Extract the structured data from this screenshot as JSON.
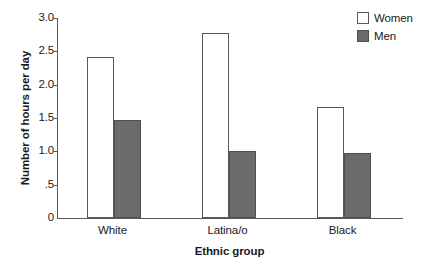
{
  "chart_data": {
    "type": "bar",
    "title": "",
    "subtitle": "",
    "xlabel": "Ethnic group",
    "ylabel": "Number of hours per day",
    "categories": [
      "White",
      "Latina/o",
      "Black"
    ],
    "series": [
      {
        "name": "Women",
        "values": [
          2.42,
          2.77,
          1.66
        ],
        "color": "#ffffff",
        "edge_color": "#58595b"
      },
      {
        "name": "Men",
        "values": [
          1.47,
          1.01,
          0.97
        ],
        "color": "#6b6b6b",
        "edge_color": "#4f4f4f"
      }
    ],
    "ylim": [
      0,
      3.0
    ],
    "yticks": [
      0,
      0.5,
      1.0,
      1.5,
      2.0,
      2.5,
      3.0
    ],
    "ytick_labels": [
      "0",
      ".5",
      "1.0",
      "1.5",
      "2.0",
      "2.5",
      "3.0"
    ],
    "grid": false,
    "legend_position": "top-right",
    "legend_entries": [
      "Women",
      "Men"
    ]
  }
}
